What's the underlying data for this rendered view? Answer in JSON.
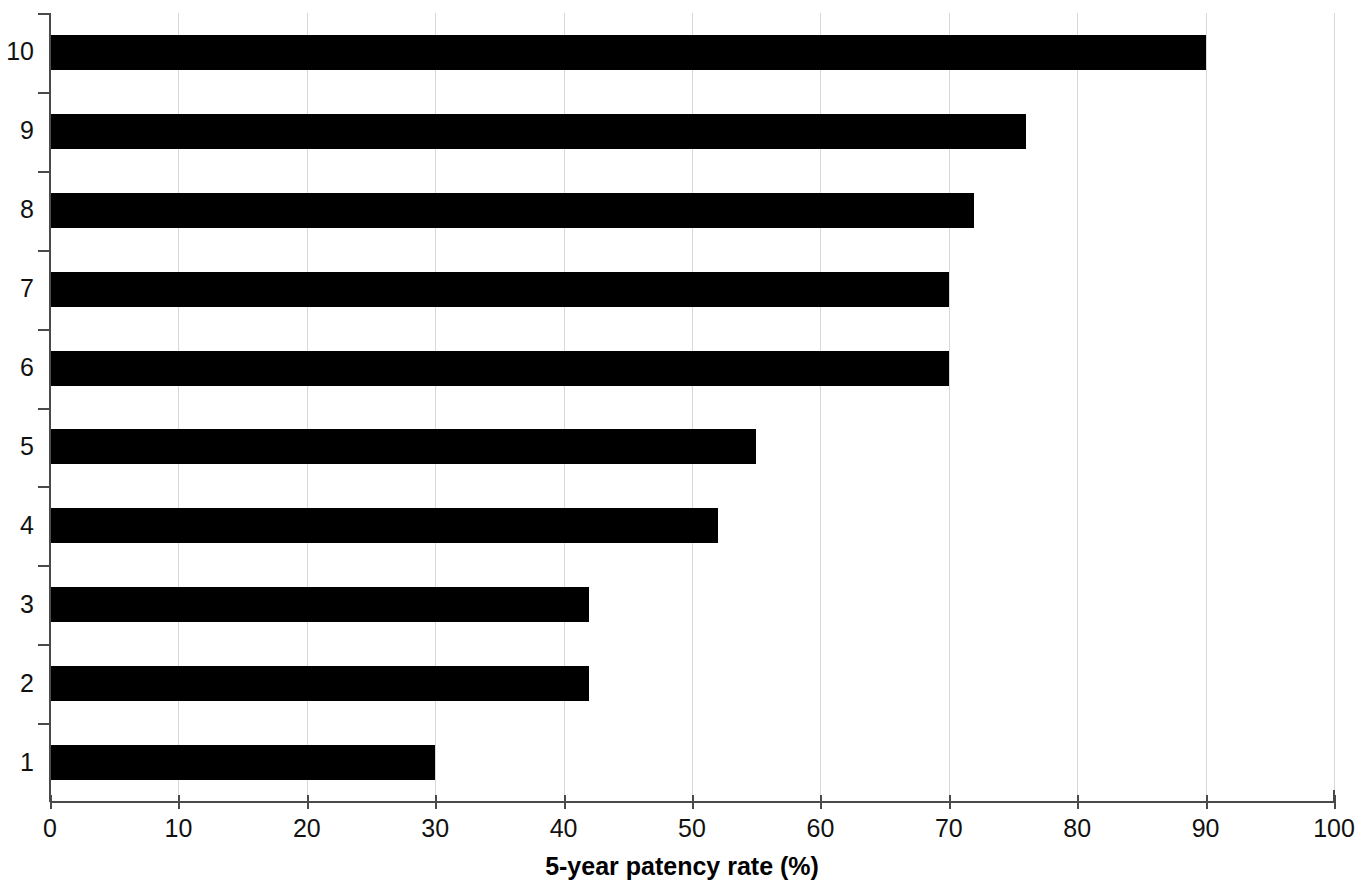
{
  "chart_data": {
    "type": "bar",
    "orientation": "horizontal",
    "title": "",
    "subtitle": "",
    "xlabel": "5-year patency rate (%)",
    "ylabel": "",
    "categories": [
      "1",
      "2",
      "3",
      "4",
      "5",
      "6",
      "7",
      "8",
      "9",
      "10"
    ],
    "values": [
      30,
      42,
      42,
      52,
      55,
      70,
      70,
      72,
      76,
      90
    ],
    "xlim": [
      0,
      100
    ],
    "xticks": [
      0,
      10,
      20,
      30,
      40,
      50,
      60,
      70,
      80,
      90,
      100
    ],
    "xtick_labels": [
      "0",
      "10",
      "20",
      "30",
      "40",
      "50",
      "60",
      "70",
      "80",
      "90",
      "100"
    ],
    "ytick_labels": [
      "1",
      "2",
      "3",
      "4",
      "5",
      "6",
      "7",
      "8",
      "9",
      "10"
    ],
    "grid": true,
    "grid_axis": "x",
    "legend": false,
    "legend_position": "none",
    "bar_color": "#000000",
    "gridline_color": "#d8d8d8",
    "axis_color": "#4a4a4a",
    "background_color": "#ffffff"
  }
}
